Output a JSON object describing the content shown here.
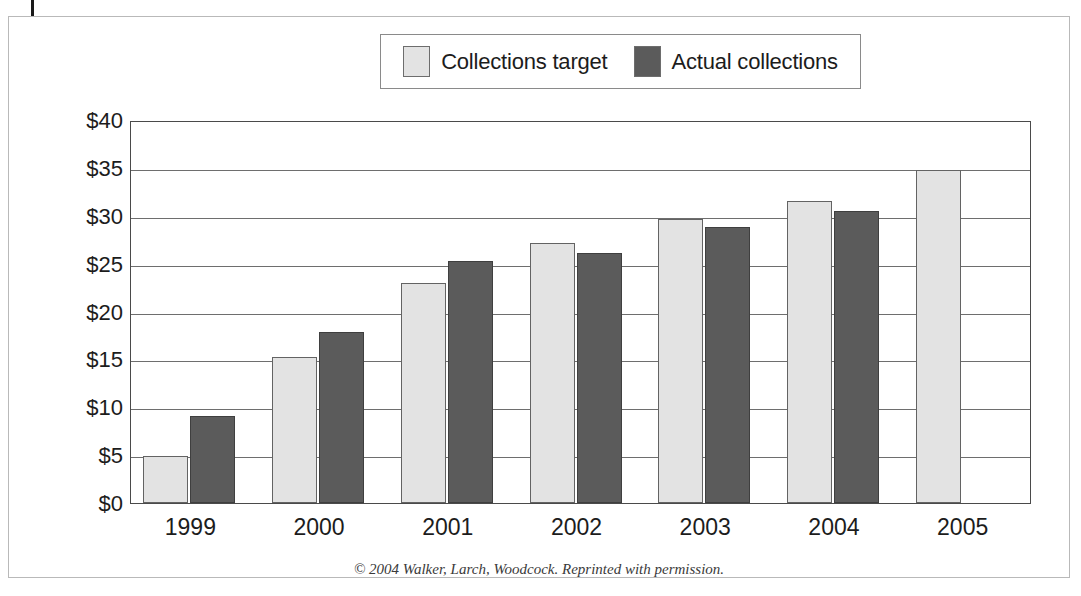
{
  "figure": {
    "credit": "© 2004 Walker, Larch, Woodcock. Reprinted with permission."
  },
  "legend": {
    "position": "top-center",
    "entries": [
      {
        "label": "Collections target",
        "color": "#e3e3e3",
        "swatch_name": "legend-swatch-collections-target"
      },
      {
        "label": "Actual collections",
        "color": "#5b5b5b",
        "swatch_name": "legend-swatch-actual-collections"
      }
    ]
  },
  "chart_data": {
    "type": "bar",
    "title": "",
    "subtitle": "",
    "xlabel": "",
    "ylabel": "Millions",
    "categories": [
      "1999",
      "2000",
      "2001",
      "2002",
      "2003",
      "2004",
      "2005"
    ],
    "series": [
      {
        "name": "Collections target",
        "color": "#e3e3e3",
        "values": [
          4.9,
          15.3,
          23.0,
          27.2,
          29.7,
          31.5,
          34.8
        ]
      },
      {
        "name": "Actual collections",
        "color": "#5b5b5b",
        "values": [
          9.1,
          17.9,
          25.3,
          26.1,
          28.8,
          30.5,
          null
        ]
      }
    ],
    "ylim": [
      0,
      40
    ],
    "ytick_values": [
      0,
      5,
      10,
      15,
      20,
      25,
      30,
      35,
      40
    ],
    "ytick_labels": [
      "$0",
      "$5",
      "$10",
      "$15",
      "$20",
      "$25",
      "$30",
      "$35",
      "$40"
    ],
    "grid": "horizontal",
    "legend_position": "top-center",
    "value_unit": "millions of dollars"
  }
}
